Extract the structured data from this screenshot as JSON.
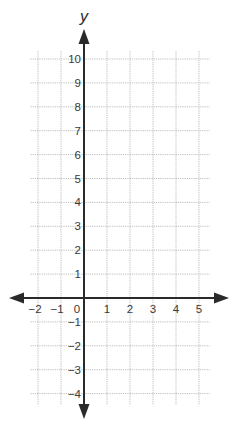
{
  "chart_data": {
    "type": "coordinate_plane",
    "title": "",
    "xlabel": "",
    "ylabel": "y",
    "xlim": [
      -2.5,
      5.5
    ],
    "ylim": [
      -4.5,
      10.5
    ],
    "grid": true,
    "x_ticks": [
      -2,
      -1,
      0,
      1,
      2,
      3,
      4,
      5
    ],
    "x_tick_labels": [
      "−2",
      "−1",
      "0",
      "1",
      "2",
      "3",
      "4",
      "5"
    ],
    "y_ticks": [
      10,
      9,
      8,
      7,
      6,
      5,
      4,
      3,
      2,
      1,
      -1,
      -2,
      -3,
      -4
    ],
    "y_tick_labels": [
      "10",
      "9",
      "8",
      "7",
      "6",
      "5",
      "4",
      "3",
      "2",
      "1",
      "−1",
      "−2",
      "−3",
      "−4"
    ],
    "series": []
  },
  "colors": {
    "axis": "#2a2a2a",
    "grid": "#bdbdbd",
    "label": "#3a3a3a",
    "background": "#ffffff"
  }
}
